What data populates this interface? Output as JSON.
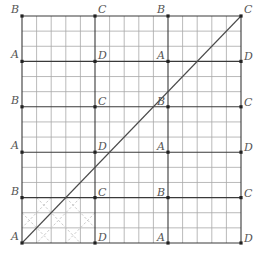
{
  "diagram": {
    "grid": {
      "x0": 22,
      "y0": 16,
      "x1": 241,
      "y1": 243,
      "cols": 15,
      "rows": 15,
      "thick_every_col": 5,
      "thick_every_row": 3
    },
    "vertical_lines_x": [
      22,
      95,
      168,
      241
    ],
    "horizontal_lines_y": [
      16,
      61.4,
      106.8,
      152.2,
      197.6,
      243
    ],
    "corner_labels": [
      {
        "row": 0,
        "labels": [
          "B",
          "C",
          "B",
          "C"
        ]
      },
      {
        "row": 1,
        "labels": [
          "A",
          "D",
          "A",
          "D"
        ]
      },
      {
        "row": 2,
        "labels": [
          "B",
          "C",
          "B",
          "C"
        ]
      },
      {
        "row": 3,
        "labels": [
          "A",
          "D",
          "A",
          "D"
        ]
      },
      {
        "row": 4,
        "labels": [
          "B",
          "C",
          "B",
          "C"
        ]
      },
      {
        "row": 5,
        "labels": [
          "A",
          "D",
          "A",
          "D"
        ]
      }
    ],
    "main_diagonal": {
      "from": "A (bottom-left)",
      "to": "C (top-right)"
    },
    "dashed_block": {
      "col": 0,
      "row": 4,
      "pattern": "diagonal lattice"
    },
    "colors": {
      "thin_grid": "#a8a8a8",
      "thick_grid": "#3a3a3a",
      "dashed": "#c4c4c4",
      "diagonal": "#4a4a4a",
      "label": "#555555",
      "dot": "#222222"
    }
  }
}
